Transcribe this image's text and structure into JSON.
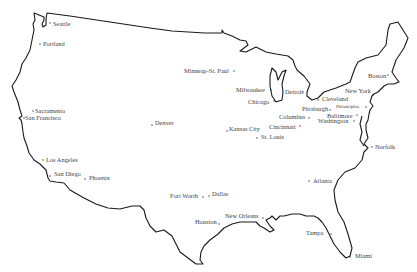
{
  "map": {
    "title": "Continental United States - Major Cities",
    "colors": {
      "outline": "#1a1a1a",
      "label": "#444444",
      "background": "#ffffff"
    },
    "cities": [
      {
        "name": "Seattle",
        "dot": [
          50,
          23
        ],
        "label": [
          53,
          25.5
        ]
      },
      {
        "name": "Portland",
        "dot": [
          40,
          44
        ],
        "label": [
          43,
          46
        ]
      },
      {
        "name": "Sacramento",
        "dot": [
          33,
          111
        ],
        "label": [
          35,
          113
        ]
      },
      {
        "name": "San Francisco",
        "dot": [
          24,
          118
        ],
        "label": [
          25,
          120
        ]
      },
      {
        "name": "Los Angeles",
        "dot": [
          43,
          160
        ],
        "label": [
          46,
          162
        ]
      },
      {
        "name": "San Diego",
        "dot": [
          50,
          176
        ],
        "label": [
          54,
          176
        ]
      },
      {
        "name": "Phoenix",
        "dot": [
          85,
          179
        ],
        "label": [
          89,
          180
        ]
      },
      {
        "name": "Denver",
        "dot": [
          152,
          125
        ],
        "label": [
          155,
          125
        ]
      },
      {
        "name": "Minneap-St. Paul",
        "dot": [
          234,
          71
        ],
        "label": [
          184,
          73
        ]
      },
      {
        "name": "Milwaukee",
        "dot": [
          271,
          90
        ],
        "label": [
          236,
          92
        ]
      },
      {
        "name": "Chicago",
        "dot": [
          274,
          101
        ],
        "label": [
          248,
          104
        ]
      },
      {
        "name": "Detroit",
        "dot": [
          303,
          92
        ],
        "label": [
          285,
          94
        ]
      },
      {
        "name": "Cleveland",
        "dot": [
          318,
          100
        ],
        "label": [
          322,
          101
        ]
      },
      {
        "name": "Pittsburgh",
        "dot": [
          330,
          110
        ],
        "label": [
          302,
          111
        ]
      },
      {
        "name": "Columbus",
        "dot": [
          309,
          118
        ],
        "label": [
          279,
          119
        ]
      },
      {
        "name": "Cincinnati",
        "dot": [
          300,
          126
        ],
        "label": [
          269,
          129
        ]
      },
      {
        "name": "Kansas City",
        "dot": [
          227,
          131
        ],
        "label": [
          229,
          131
        ]
      },
      {
        "name": "St. Louis",
        "dot": [
          257,
          138
        ],
        "label": [
          261,
          139
        ]
      },
      {
        "name": "Philadelphia",
        "dot": [
          366,
          107
        ],
        "label": [
          336,
          108
        ],
        "small": true
      },
      {
        "name": "Baltimore",
        "dot": [
          357,
          115
        ],
        "label": [
          327,
          118
        ]
      },
      {
        "name": "Washington",
        "dot": [
          354,
          121
        ],
        "label": [
          318,
          123
        ]
      },
      {
        "name": "New York",
        "dot": [
          373,
          95
        ],
        "label": [
          345,
          93
        ]
      },
      {
        "name": "Boston",
        "dot": [
          388,
          75
        ],
        "label": [
          368,
          78
        ]
      },
      {
        "name": "Norfolk",
        "dot": [
          372,
          147
        ],
        "label": [
          375,
          149
        ]
      },
      {
        "name": "Atlanta",
        "dot": [
          309,
          181
        ],
        "label": [
          313,
          183
        ]
      },
      {
        "name": "Fort Worth",
        "dot": [
          203,
          197
        ],
        "label": [
          170,
          198
        ]
      },
      {
        "name": "Dallas",
        "dot": [
          209,
          196
        ],
        "label": [
          212,
          196
        ]
      },
      {
        "name": "Houston",
        "dot": [
          219,
          224
        ],
        "label": [
          195,
          224
        ]
      },
      {
        "name": "New Orleans",
        "dot": [
          263,
          218
        ],
        "label": [
          225,
          218
        ]
      },
      {
        "name": "Tampa",
        "dot": [
          331,
          234
        ],
        "label": [
          306,
          235
        ]
      },
      {
        "name": "Miami",
        "dot": [
          350,
          257
        ],
        "label": [
          355,
          258
        ]
      }
    ]
  }
}
